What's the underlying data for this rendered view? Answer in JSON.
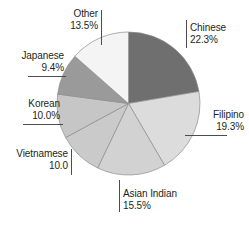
{
  "figure": {
    "background_color": "#ffffff",
    "width": 249,
    "height": 228
  },
  "chart_data": {
    "type": "pie",
    "title": "",
    "subtitle": "",
    "xlabel": "",
    "ylabel": "",
    "legend_position": "none",
    "grid": false,
    "start_angle_deg": 0,
    "direction": "clockwise",
    "categories": [
      "Chinese",
      "Filipino",
      "Asian Indian",
      "Vietnamese",
      "Korean",
      "Japanese",
      "Other"
    ],
    "values": [
      22.3,
      19.3,
      15.5,
      10.0,
      10.0,
      9.4,
      13.5
    ],
    "value_labels": [
      "22.3%",
      "19.3%",
      "15.5%",
      "10.0",
      "10.0%",
      "9.4%",
      "13.5%"
    ],
    "colors": [
      "#6f6f6f",
      "#dcdcdc",
      "#d2d2d2",
      "#cacaca",
      "#c6c6c6",
      "#9a9a9a",
      "#f4f4f4"
    ],
    "slice_edge_color": "#8c8c8c",
    "units": "percent"
  },
  "labels": {
    "chinese": {
      "name": "Chinese",
      "value": "22.3%"
    },
    "filipino": {
      "name": "Filipino",
      "value": "19.3%"
    },
    "asian_indian": {
      "name": "Asian Indian",
      "value": "15.5%"
    },
    "vietnamese": {
      "name": "Vietnamese",
      "value": "10.0"
    },
    "korean": {
      "name": "Korean",
      "value": "10.0%"
    },
    "japanese": {
      "name": "Japanese",
      "value": "9.4%"
    },
    "other": {
      "name": "Other",
      "value": "13.5%"
    }
  }
}
